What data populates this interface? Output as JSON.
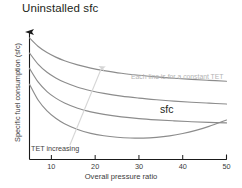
{
  "chart_data": {
    "type": "line",
    "title": "Uninstalled sfc",
    "xlabel": "Overall pressure ratio",
    "ylabel": "Specific fuel consumption (sfc)",
    "xlim": [
      5,
      50
    ],
    "ylim": [
      0,
      1
    ],
    "xticks": [
      10,
      20,
      30,
      40,
      50
    ],
    "xtick_labels": [
      "10",
      "20",
      "30",
      "40",
      "50"
    ],
    "yticks": [],
    "ytick_labels": [],
    "grid": false,
    "legend": null,
    "annotations": [
      {
        "id": "constant-tet",
        "text": "Each line is for a constant TET",
        "x": 32.5,
        "y": 0.63
      },
      {
        "id": "sfc",
        "text": "sfc",
        "x": 38.5,
        "y": 0.43
      },
      {
        "id": "tet-increasing",
        "text": "TET increasing",
        "x": 12.5,
        "y": 0.11
      }
    ],
    "series": [
      {
        "name": "TET 1 (lowest TET)",
        "color": "#8c8c8c",
        "points": [
          [
            5,
            0.985
          ],
          [
            7,
            0.915
          ],
          [
            9,
            0.866
          ],
          [
            11,
            0.829
          ],
          [
            13,
            0.8
          ],
          [
            16,
            0.766
          ],
          [
            19,
            0.74
          ],
          [
            22,
            0.72
          ],
          [
            26,
            0.698
          ],
          [
            30,
            0.682
          ],
          [
            34,
            0.669
          ],
          [
            38,
            0.658
          ],
          [
            42,
            0.649
          ],
          [
            46,
            0.641
          ],
          [
            50,
            0.634
          ]
        ]
      },
      {
        "name": "TET 2",
        "color": "#8c8c8c",
        "points": [
          [
            5,
            0.862
          ],
          [
            7,
            0.77
          ],
          [
            9,
            0.706
          ],
          [
            11,
            0.66
          ],
          [
            13,
            0.625
          ],
          [
            16,
            0.585
          ],
          [
            19,
            0.557
          ],
          [
            22,
            0.535
          ],
          [
            26,
            0.513
          ],
          [
            30,
            0.497
          ],
          [
            34,
            0.484
          ],
          [
            38,
            0.473
          ],
          [
            42,
            0.464
          ],
          [
            46,
            0.456
          ],
          [
            50,
            0.449
          ]
        ]
      },
      {
        "name": "TET 3",
        "color": "#8c8c8c",
        "points": [
          [
            5,
            0.738
          ],
          [
            7,
            0.626
          ],
          [
            9,
            0.55
          ],
          [
            11,
            0.497
          ],
          [
            13,
            0.458
          ],
          [
            16,
            0.415
          ],
          [
            19,
            0.386
          ],
          [
            22,
            0.365
          ],
          [
            26,
            0.345
          ],
          [
            30,
            0.331
          ],
          [
            34,
            0.321
          ],
          [
            38,
            0.313
          ],
          [
            42,
            0.306
          ],
          [
            46,
            0.301
          ],
          [
            50,
            0.296
          ]
        ]
      },
      {
        "name": "TET 4 (highest TET)",
        "color": "#8c8c8c",
        "points": [
          [
            5,
            0.61
          ],
          [
            7,
            0.48
          ],
          [
            9,
            0.394
          ],
          [
            11,
            0.334
          ],
          [
            13,
            0.29
          ],
          [
            16,
            0.243
          ],
          [
            19,
            0.212
          ],
          [
            22,
            0.192
          ],
          [
            25,
            0.18
          ],
          [
            28,
            0.174
          ],
          [
            31,
            0.173
          ],
          [
            34,
            0.179
          ],
          [
            37,
            0.191
          ],
          [
            40,
            0.21
          ],
          [
            43,
            0.236
          ],
          [
            46,
            0.268
          ],
          [
            50,
            0.32
          ]
        ]
      }
    ],
    "arrows": [
      {
        "id": "tet-increasing-arrow",
        "from": [
          14.2,
          0.115
        ],
        "to": [
          21.5,
          0.745
        ],
        "color": "#d6d6d6"
      }
    ]
  }
}
